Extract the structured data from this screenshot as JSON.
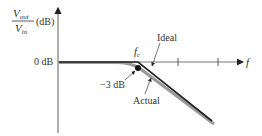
{
  "diagram": {
    "y_axis_label": {
      "numerator": "V",
      "numerator_sub": "out",
      "denominator": "V",
      "denominator_sub": "in",
      "unit": "(dB)"
    },
    "x_axis_label": "f",
    "zero_db_label": "0 dB",
    "cutoff_label": "f",
    "cutoff_sub": "c",
    "minus3db_label": "−3 dB",
    "ideal_label": "Ideal",
    "actual_label": "Actual",
    "colors": {
      "axis": "#777777",
      "curve_ideal": "#222222",
      "curve_actual": "#999999",
      "text": "#333333"
    }
  }
}
